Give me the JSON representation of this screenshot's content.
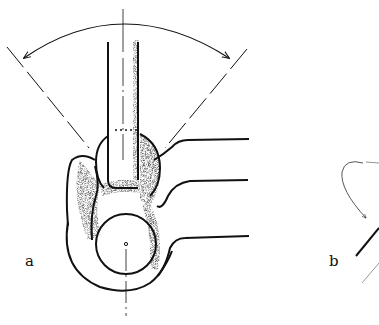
{
  "figure": {
    "labels": {
      "a": "a",
      "b": "b"
    },
    "colors": {
      "ink": "#111111",
      "stipple": "#333333",
      "background": "#ffffff"
    }
  }
}
